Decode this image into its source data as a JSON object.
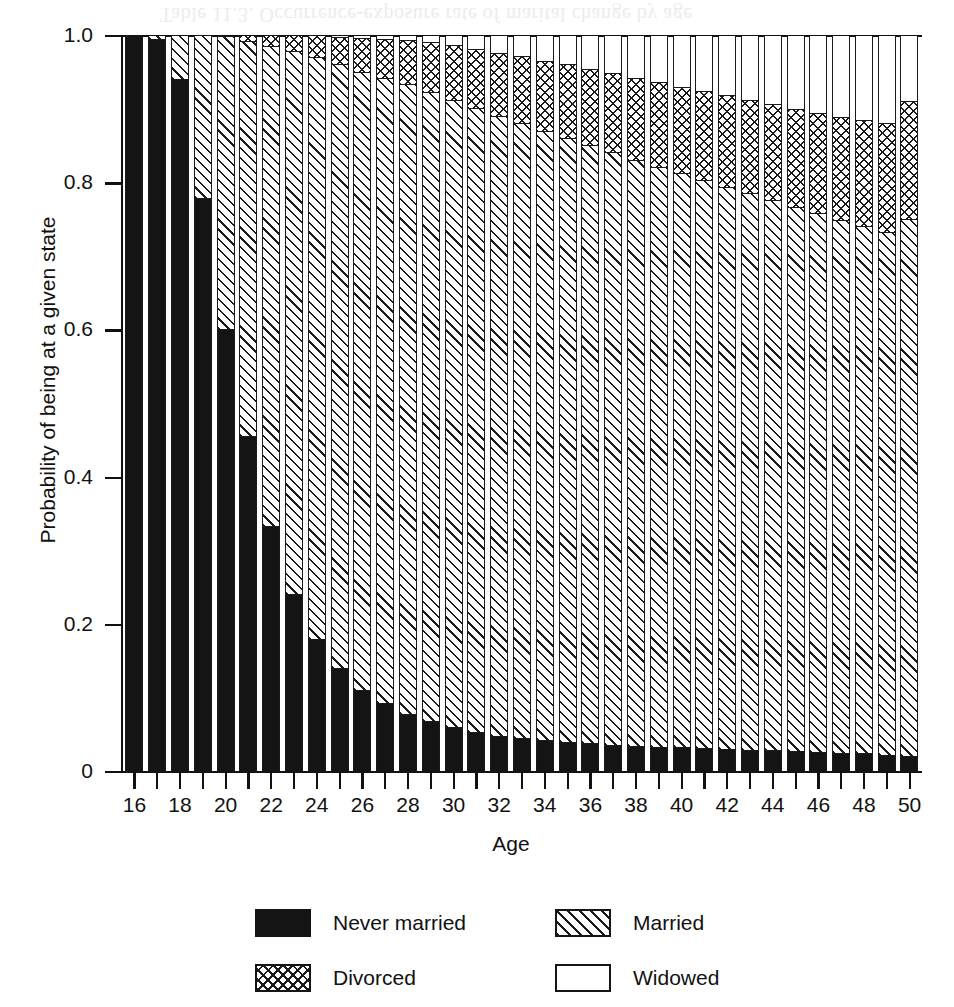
{
  "page": {
    "bleed_through_text": "Table 11.3.  Occurrence-exposure rate of marital change by age"
  },
  "chart_data": {
    "type": "bar",
    "subtype": "stacked-bar",
    "title": "",
    "xlabel": "Age",
    "ylabel": "Probability of being at a given state",
    "xlim": [
      15.5,
      50.5
    ],
    "ylim": [
      0,
      1.0
    ],
    "grid": false,
    "legend_position": "below-plot",
    "y_ticks": [
      "1.0",
      "0.8",
      "0.6",
      "0.4",
      "0.2",
      "0"
    ],
    "y_tick_values": [
      1.0,
      0.8,
      0.6,
      0.4,
      0.2,
      0
    ],
    "x_ticks": [
      "16",
      "18",
      "20",
      "22",
      "24",
      "26",
      "28",
      "30",
      "32",
      "34",
      "36",
      "38",
      "40",
      "42",
      "44",
      "46",
      "48",
      "50"
    ],
    "x_tick_values": [
      16,
      18,
      20,
      22,
      24,
      26,
      28,
      30,
      32,
      34,
      36,
      38,
      40,
      42,
      44,
      46,
      48,
      50
    ],
    "categories": [
      16,
      17,
      18,
      19,
      20,
      21,
      22,
      23,
      24,
      25,
      26,
      27,
      28,
      29,
      30,
      31,
      32,
      33,
      34,
      35,
      36,
      37,
      38,
      39,
      40,
      41,
      42,
      43,
      44,
      45,
      46,
      47,
      48,
      49,
      50
    ],
    "series": [
      {
        "name": "Never married",
        "pattern": "solid-black",
        "color": "#141414",
        "values": [
          1.0,
          0.995,
          0.94,
          0.778,
          0.6,
          0.455,
          0.333,
          0.24,
          0.18,
          0.14,
          0.11,
          0.092,
          0.078,
          0.068,
          0.06,
          0.053,
          0.048,
          0.045,
          0.042,
          0.04,
          0.038,
          0.036,
          0.034,
          0.033,
          0.032,
          0.031,
          0.03,
          0.029,
          0.028,
          0.027,
          0.026,
          0.025,
          0.024,
          0.022,
          0.02
        ]
      },
      {
        "name": "Married",
        "pattern": "diagonal-hatch",
        "color": "#ffffff",
        "values": [
          0.0,
          0.005,
          0.06,
          0.222,
          0.398,
          0.537,
          0.652,
          0.738,
          0.79,
          0.82,
          0.84,
          0.85,
          0.855,
          0.855,
          0.852,
          0.848,
          0.842,
          0.835,
          0.827,
          0.82,
          0.812,
          0.805,
          0.796,
          0.788,
          0.78,
          0.772,
          0.764,
          0.756,
          0.748,
          0.74,
          0.732,
          0.724,
          0.716,
          0.71,
          0.73
        ]
      },
      {
        "name": "Divorced",
        "pattern": "crosshatch",
        "color": "#ffffff",
        "values": [
          0.0,
          0.0,
          0.0,
          0.0,
          0.002,
          0.008,
          0.015,
          0.022,
          0.03,
          0.038,
          0.046,
          0.053,
          0.06,
          0.067,
          0.074,
          0.08,
          0.086,
          0.091,
          0.096,
          0.1,
          0.104,
          0.108,
          0.112,
          0.115,
          0.118,
          0.121,
          0.124,
          0.127,
          0.13,
          0.133,
          0.136,
          0.14,
          0.144,
          0.148,
          0.16
        ]
      },
      {
        "name": "Widowed",
        "pattern": "empty-white",
        "color": "#ffffff",
        "values": [
          0.0,
          0.0,
          0.0,
          0.0,
          0.0,
          0.0,
          0.0,
          0.0,
          0.0,
          0.002,
          0.004,
          0.005,
          0.007,
          0.01,
          0.014,
          0.019,
          0.024,
          0.029,
          0.035,
          0.04,
          0.046,
          0.051,
          0.058,
          0.064,
          0.07,
          0.076,
          0.082,
          0.088,
          0.094,
          0.1,
          0.106,
          0.111,
          0.116,
          0.12,
          0.09
        ]
      }
    ]
  },
  "legend": {
    "items": [
      {
        "label": "Never married",
        "swatch": "sw-never"
      },
      {
        "label": "Married",
        "swatch": "sw-married"
      },
      {
        "label": "Divorced",
        "swatch": "sw-divorced"
      },
      {
        "label": "Widowed",
        "swatch": "sw-widowed"
      }
    ]
  }
}
